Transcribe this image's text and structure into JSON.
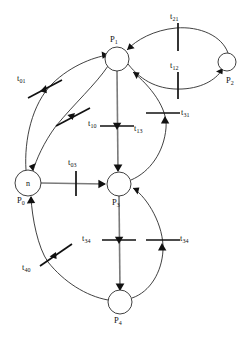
{
  "diagram": {
    "type": "petri-net",
    "title": "",
    "width": 251,
    "height": 337,
    "colors": {
      "stroke": "#2b2b2b",
      "arc_highlight": "#7a7a7a",
      "transition": "#111111",
      "background": "#ffffff"
    }
  },
  "places": [
    {
      "id": "P0",
      "label": "P",
      "sub": "0",
      "token": "n",
      "cx": 28,
      "cy": 183,
      "r": 13,
      "label_x": 17,
      "label_y": 201
    },
    {
      "id": "P1",
      "label": "P",
      "sub": "1",
      "token": "",
      "cx": 117,
      "cy": 59,
      "r": 12,
      "label_x": 110,
      "label_y": 40
    },
    {
      "id": "P2",
      "label": "P",
      "sub": "2",
      "token": "",
      "cx": 227,
      "cy": 62,
      "r": 9,
      "label_x": 226,
      "label_y": 81
    },
    {
      "id": "P3",
      "label": "P",
      "sub": "3",
      "token": "",
      "cx": 119,
      "cy": 184,
      "r": 12,
      "label_x": 112,
      "label_y": 203
    },
    {
      "id": "P4",
      "label": "P",
      "sub": "4",
      "token": "",
      "cx": 120,
      "cy": 302,
      "r": 12,
      "label_x": 114,
      "label_y": 321
    }
  ],
  "transitions": [
    {
      "id": "t01",
      "label": "t",
      "sub": "01",
      "x": 44,
      "y": 89,
      "angle": -28,
      "label_x": 17,
      "label_y": 79
    },
    {
      "id": "t10",
      "label": "t",
      "sub": "10",
      "x": 72,
      "y": 117,
      "angle": -28,
      "label_x": 88,
      "label_y": 124
    },
    {
      "id": "t21",
      "label": "t",
      "sub": "21",
      "x": 178,
      "y": 37,
      "angle": 0,
      "label_x": 170,
      "label_y": 17
    },
    {
      "id": "t12",
      "label": "t",
      "sub": "12",
      "x": 178,
      "y": 85,
      "angle": 0,
      "label_x": 170,
      "label_y": 66
    },
    {
      "id": "t13",
      "label": "t",
      "sub": "13",
      "x": 117,
      "y": 126,
      "angle": 90,
      "label_x": 134,
      "label_y": 129
    },
    {
      "id": "t31",
      "label": "t",
      "sub": "31",
      "x": 165,
      "y": 113,
      "angle": 90,
      "label_x": 181,
      "label_y": 113
    },
    {
      "id": "t03",
      "label": "t",
      "sub": "03",
      "x": 76,
      "y": 183,
      "angle": 0,
      "label_x": 68,
      "label_y": 163
    },
    {
      "id": "t34",
      "label": "t",
      "sub": "34",
      "x": 119,
      "y": 240,
      "angle": 90,
      "label_x": 91,
      "label_y": 239
    },
    {
      "id": "t43",
      "label": "t",
      "sub": "34",
      "x": 162,
      "y": 240,
      "angle": 90,
      "label_x": 180,
      "label_y": 239
    },
    {
      "id": "t40",
      "label": "t",
      "sub": "40",
      "x": 55,
      "y": 256,
      "angle": -35,
      "label_x": 28,
      "label_y": 268
    }
  ],
  "arcs": [
    {
      "id": "arc-p0-t01-p1",
      "from": "P0",
      "to": "P1",
      "via": "t01"
    },
    {
      "id": "arc-p1-t10-p0",
      "from": "P1",
      "to": "P0",
      "via": "t10"
    },
    {
      "id": "arc-p1-t12-p2",
      "from": "P1",
      "to": "P2",
      "via": "t12"
    },
    {
      "id": "arc-p2-t21-p1",
      "from": "P2",
      "to": "P1",
      "via": "t21"
    },
    {
      "id": "arc-p1-t13-p3",
      "from": "P1",
      "to": "P3",
      "via": "t13"
    },
    {
      "id": "arc-p3-t31-p1",
      "from": "P3",
      "to": "P1",
      "via": "t31"
    },
    {
      "id": "arc-p0-t03-p3",
      "from": "P0",
      "to": "P3",
      "via": "t03"
    },
    {
      "id": "arc-p3-t34-p4",
      "from": "P3",
      "to": "P4",
      "via": "t34"
    },
    {
      "id": "arc-p4-t43-p3",
      "from": "P4",
      "to": "P3",
      "via": "t43"
    },
    {
      "id": "arc-p4-t40-p0",
      "from": "P4",
      "to": "P0",
      "via": "t40"
    }
  ]
}
